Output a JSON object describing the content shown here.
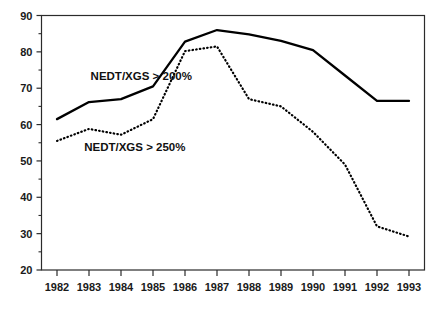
{
  "chart_data": {
    "type": "line",
    "title": "",
    "xlabel": "",
    "ylabel": "",
    "categories": [
      "1982",
      "1983",
      "1984",
      "1985",
      "1986",
      "1987",
      "1988",
      "1989",
      "1990",
      "1991",
      "1992",
      "1993"
    ],
    "xlim": [
      1982,
      1993
    ],
    "ylim": [
      20,
      90
    ],
    "y_ticks_major": [
      20,
      30,
      40,
      50,
      60,
      70,
      80,
      90
    ],
    "y_ticks_minor": [
      25,
      35,
      45,
      55,
      65,
      75,
      85
    ],
    "y_tick_labels": [
      "20",
      "30",
      "40",
      "50",
      "60",
      "70",
      "80",
      "90"
    ],
    "grid": false,
    "legend": "inline-annotations",
    "series": [
      {
        "name": "NEDT/XGS > 200%",
        "style": "solid",
        "color": "#000000",
        "values": [
          61.5,
          66.2,
          67.0,
          70.5,
          82.8,
          86.0,
          84.8,
          83.0,
          80.5,
          73.5,
          66.5,
          66.5
        ]
      },
      {
        "name": "NEDT/XGS > 250%",
        "style": "dotted",
        "color": "#000000",
        "values": [
          55.5,
          58.8,
          57.2,
          61.5,
          80.2,
          81.5,
          67.0,
          65.0,
          58.0,
          49.0,
          32.0,
          29.2
        ]
      }
    ],
    "annotations": [
      {
        "text": "NEDT/XGS > 200%",
        "x": 1983.05,
        "y": 72.2
      },
      {
        "text": "NEDT/XGS > 250%",
        "x": 1982.85,
        "y": 52.6
      }
    ]
  },
  "axes": {
    "x_tick_labels": [
      "1982",
      "1983",
      "1984",
      "1985",
      "1986",
      "1987",
      "1988",
      "1989",
      "1990",
      "1991",
      "1992",
      "1993"
    ],
    "y_tick_labels": [
      "90",
      "80",
      "70",
      "60",
      "50",
      "40",
      "30",
      "20"
    ]
  },
  "colors": {
    "frame": "#2b2b2b",
    "line": "#000000",
    "text": "#1a1a1a",
    "background": "#ffffff"
  }
}
